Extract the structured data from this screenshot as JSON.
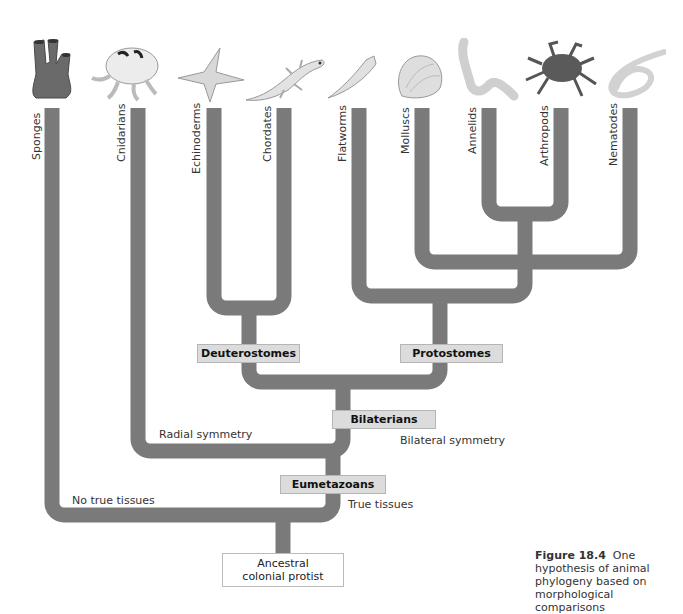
{
  "taxa": [
    {
      "name": "Sponges",
      "icon": "sponge-icon"
    },
    {
      "name": "Cnidarians",
      "icon": "jellyfish-icon"
    },
    {
      "name": "Echinoderms",
      "icon": "starfish-icon"
    },
    {
      "name": "Chordates",
      "icon": "salamander-icon"
    },
    {
      "name": "Flatworms",
      "icon": "flatworm-icon"
    },
    {
      "name": "Molluscs",
      "icon": "shell-icon"
    },
    {
      "name": "Annelids",
      "icon": "segmented-worm-icon"
    },
    {
      "name": "Arthropods",
      "icon": "crab-icon"
    },
    {
      "name": "Nematodes",
      "icon": "roundworm-icon"
    }
  ],
  "clades": {
    "deuterostomes": "Deuterostomes",
    "protostomes": "Protostomes",
    "bilaterians": "Bilaterians",
    "eumetazoans": "Eumetazoans"
  },
  "traits": {
    "radial": "Radial symmetry",
    "bilateral": "Bilateral symmetry",
    "no_tissues": "No true tissues",
    "true_tissues": "True tissues"
  },
  "root": {
    "line1": "Ancestral",
    "line2": "colonial protist"
  },
  "caption": {
    "label": "Figure 18.4",
    "text": "One hypothesis of animal phylogeny based on morphological comparisons"
  },
  "colors": {
    "branch": "#7a7a7a",
    "clade_box": "#dcdcdc"
  }
}
